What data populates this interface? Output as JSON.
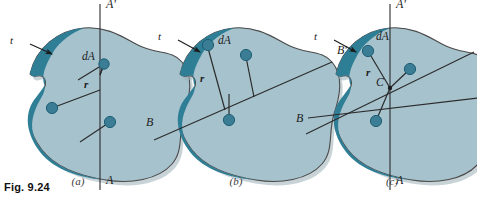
{
  "figure": {
    "caption": "Fig. 9.24",
    "colors": {
      "area_fill": "#a6c2cd",
      "area_fill_light": "#b4ccd6",
      "edge_band": "#2e7e96",
      "outline": "#4a4a4a",
      "dot": "#3a7d94",
      "dot_stroke": "#1d5f75",
      "axis_line": "#2b2b2b",
      "text": "#1c1c1c",
      "background": "#ffffff"
    }
  },
  "panels": [
    {
      "id": "panel-a",
      "caption": "(a)",
      "axis_name": "AA'",
      "description": "Moment of inertia about axis AA'",
      "labels": {
        "axis_top": "A'",
        "axis_bottom": "A",
        "thickness": "t",
        "element": "dA",
        "radius": "r"
      },
      "elements": [
        {
          "name": "dA",
          "cx": 104,
          "cy": 64,
          "radius_label": "r"
        },
        {
          "name": "element-2",
          "cx": 52,
          "cy": 108,
          "radius_label": ""
        },
        {
          "name": "element-3",
          "cx": 110,
          "cy": 122,
          "radius_label": ""
        }
      ]
    },
    {
      "id": "panel-b",
      "caption": "(b)",
      "axis_name": "BB'",
      "description": "Moment of inertia about axis BB'",
      "labels": {
        "axis_left": "B",
        "axis_right": "B'",
        "thickness": "t",
        "element": "dA",
        "radius": "r"
      },
      "elements": [
        {
          "name": "dA",
          "cx": 208,
          "cy": 45,
          "radius_label": "r"
        },
        {
          "name": "element-2",
          "cx": 246,
          "cy": 55,
          "radius_label": ""
        },
        {
          "name": "element-3",
          "cx": 229,
          "cy": 120,
          "radius_label": ""
        }
      ]
    },
    {
      "id": "panel-c",
      "caption": "(c)",
      "axis_name": "C",
      "description": "Polar moment of inertia about point C",
      "labels": {
        "axis_top": "A'",
        "axis_bottom": "A",
        "axis_left": "B",
        "axis_right": "B'",
        "axis_right_2": "C'",
        "center": "C",
        "thickness": "t",
        "element": "dA",
        "radius": "r"
      },
      "center": {
        "cx": 389,
        "cy": 88
      },
      "elements": [
        {
          "name": "dA",
          "cx": 367,
          "cy": 50,
          "radius_label": "r"
        },
        {
          "name": "element-2",
          "cx": 409,
          "cy": 69,
          "radius_label": ""
        },
        {
          "name": "element-3",
          "cx": 375,
          "cy": 120,
          "radius_label": ""
        }
      ]
    }
  ]
}
